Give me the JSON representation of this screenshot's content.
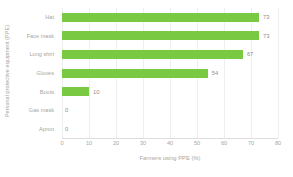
{
  "chart_data": {
    "type": "bar",
    "orientation": "horizontal",
    "title": "",
    "xlabel": "Farmers using PPE (%)",
    "ylabel": "Personal protective equipment (PPE)",
    "categories": [
      "Hat",
      "Face mask",
      "Long shirt",
      "Gloves",
      "Boots",
      "Gas mask",
      "Apron"
    ],
    "values": [
      73,
      73,
      67,
      54,
      10,
      0,
      0
    ],
    "value_labels": [
      "73",
      "73",
      "67",
      "54",
      "10",
      "0",
      "0"
    ],
    "xlim": [
      0,
      80
    ],
    "xticks": [
      0,
      10,
      20,
      30,
      40,
      50,
      60,
      70,
      80
    ],
    "xtick_labels": [
      "0",
      "10",
      "20",
      "30",
      "40",
      "50",
      "60",
      "70",
      "80"
    ],
    "grid": true,
    "grid_axis": "x",
    "legend": false,
    "bar_color": "#7ac943",
    "text_color": "#a6a6a6",
    "grid_color": "#eeeeee",
    "background": "#ffffff"
  }
}
